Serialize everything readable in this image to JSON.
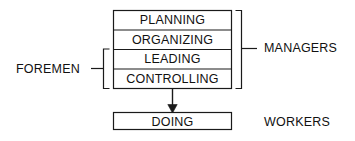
{
  "diagram": {
    "colors": {
      "stroke": "#1a1a1a",
      "text": "#111111",
      "background": "#ffffff"
    },
    "main_box": {
      "name": "management-functions-box",
      "rows": [
        {
          "key": "planning",
          "label": "PLANNING"
        },
        {
          "key": "organizing",
          "label": "ORGANIZING"
        },
        {
          "key": "leading",
          "label": "LEADING"
        },
        {
          "key": "controlling",
          "label": "CONTROLLING"
        }
      ]
    },
    "lower_box": {
      "name": "doing-box",
      "label": "DOING"
    },
    "brackets": [
      {
        "key": "managers",
        "label": "MANAGERS",
        "side": "right",
        "spans_rows": [
          "PLANNING",
          "ORGANIZING",
          "LEADING",
          "CONTROLLING"
        ]
      },
      {
        "key": "foremen",
        "label": "FOREMEN",
        "side": "left",
        "spans_rows": [
          "LEADING",
          "CONTROLLING"
        ]
      }
    ],
    "workers_label": {
      "key": "workers",
      "label": "WORKERS",
      "side": "right",
      "refers_to": "DOING"
    },
    "connector": {
      "key": "doing-arrow",
      "from": "CONTROLLING",
      "to": "DOING",
      "style": "arrow-down"
    }
  }
}
